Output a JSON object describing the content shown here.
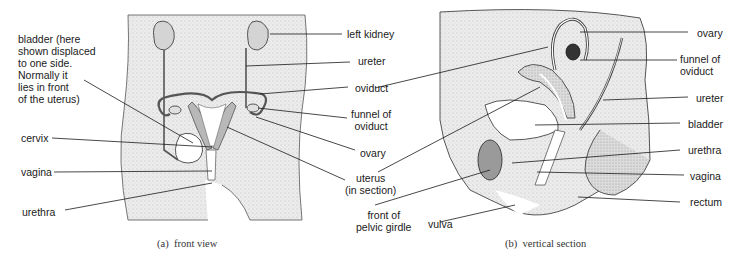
{
  "figure": {
    "panel_a": {
      "caption": "(a)  front view",
      "labels": {
        "bladder": "bladder (here\nshown displaced\nto one side.\nNormally it\nlies in front\nof the uterus)",
        "cervix": "cervix",
        "vagina": "vagina",
        "urethra": "urethra",
        "left_kidney": "left kidney",
        "ureter": "ureter",
        "oviduct": "oviduct",
        "funnel_of_oviduct": "funnel of\noviduct",
        "ovary": "ovary",
        "uterus": "uterus\n(in section)",
        "front_of_pelvic_girdle": "front of\npelvic girdle"
      }
    },
    "panel_b": {
      "caption": "(b)  vertical section",
      "labels": {
        "ovary": "ovary",
        "funnel_of_oviduct": "funnel of\noviduct",
        "ureter": "ureter",
        "bladder": "bladder",
        "urethra": "urethra",
        "vagina": "vagina",
        "rectum": "rectum",
        "vulva": "vulva"
      }
    },
    "colors": {
      "stipple": "#e6e6e6",
      "organ_grey": "#b8b8b8",
      "dark_grey": "#8a8a8a",
      "ovary_dark": "#333333",
      "line": "#1a1a1a"
    }
  }
}
